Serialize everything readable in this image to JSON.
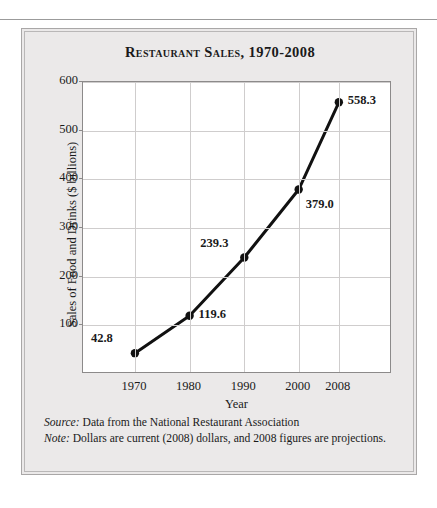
{
  "figure": {
    "title": "Restaurant Sales, 1970-2008",
    "source_label": "Source:",
    "source_text": " Data from the National Restaurant Association",
    "note_label": "Note:",
    "note_text": " Dollars are current (2008) dollars, and 2008 figures are projections."
  },
  "colors": {
    "page_background": "#ffffff",
    "figure_background": "#ebe9e9",
    "plot_background": "#ffffff",
    "grid": "#cfcdcd",
    "axis": "#8c8a8a",
    "series": "#111111",
    "text": "#1a1a1a"
  },
  "chart_data": {
    "type": "line",
    "title": "Restaurant Sales, 1970-2008",
    "xlabel": "Year",
    "ylabel": "Sales of Food and Drinks ($ billions)",
    "x": [
      1970,
      1980,
      1990,
      2000,
      2008
    ],
    "categories": [
      "1970",
      "1980",
      "1990",
      "2000",
      "2008"
    ],
    "values": [
      42.8,
      119.6,
      239.3,
      379.0,
      558.3
    ],
    "point_labels": [
      "42.8",
      "119.6",
      "239.3",
      "379.0",
      "558.3"
    ],
    "label_positions": [
      "above-left",
      "right",
      "above-left",
      "below-right",
      "right"
    ],
    "series": [
      {
        "name": "Sales of Food and Drinks",
        "values": [
          42.8,
          119.6,
          239.3,
          379.0,
          558.3
        ]
      }
    ],
    "xlim": [
      1970,
      2008
    ],
    "ylim": [
      0,
      600
    ],
    "yticks": [
      100,
      200,
      300,
      400,
      500,
      600
    ],
    "ytick_labels": [
      "100",
      "200",
      "300",
      "400",
      "500",
      "600"
    ],
    "xticks": [
      1970,
      1980,
      1990,
      2000,
      2008
    ],
    "xtick_labels": [
      "1970",
      "1980",
      "1990",
      "2000",
      "2008"
    ],
    "grid": true,
    "legend": false,
    "marker": "circle",
    "marker_color": "#111111",
    "line_color": "#111111",
    "line_width": 3
  }
}
